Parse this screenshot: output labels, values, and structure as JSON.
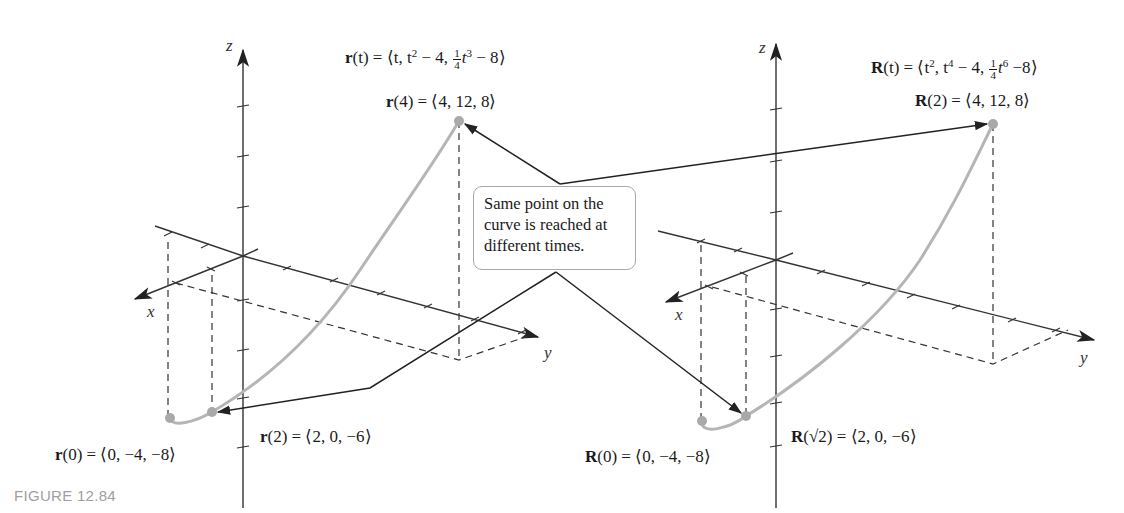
{
  "figure": {
    "caption": "FIGURE 12.84",
    "colors": {
      "axis": "#333333",
      "curve": "#b5b5b5",
      "point": "#a9a9a9",
      "arrow": "#222222",
      "callout_border": "#a8a8a8",
      "caption": "#a0a0a0"
    }
  },
  "left_plot": {
    "axes": {
      "x": "x",
      "y": "y",
      "z": "z"
    },
    "function": {
      "name": "r",
      "argument": "t",
      "components": [
        "t",
        "t² − 4",
        "¼t³ − 8"
      ]
    },
    "labels": {
      "fn_name": "r",
      "fn_arg": "(t) = ⟨t, t",
      "fn_mid1": " − 4, ",
      "fn_frac_num": "1",
      "fn_frac_den": "4",
      "fn_t": "t",
      "fn_exp3": "3",
      "fn_tail": " − 8⟩",
      "exp2": "2",
      "r4_name": "r",
      "r4_rest": "(4) = ⟨4, 12, 8⟩",
      "r2_name": "r",
      "r2_rest": "(2) = ⟨2, 0, −6⟩",
      "r0_name": "r",
      "r0_rest": "(0) = ⟨0, −4, −8⟩"
    },
    "points": [
      {
        "label": "r(0) = ⟨0, −4, −8⟩",
        "t": 0,
        "x": 0,
        "y": -4,
        "z": -8
      },
      {
        "label": "r(2) = ⟨2, 0, −6⟩",
        "t": 2,
        "x": 2,
        "y": 0,
        "z": -6
      },
      {
        "label": "r(4) = ⟨4, 12, 8⟩",
        "t": 4,
        "x": 4,
        "y": 12,
        "z": 8
      }
    ]
  },
  "right_plot": {
    "axes": {
      "x": "x",
      "y": "y",
      "z": "z"
    },
    "function": {
      "name": "R",
      "argument": "t",
      "components": [
        "t²",
        "t⁴ − 4",
        "¼t⁶ − 8"
      ]
    },
    "labels": {
      "fn_name": "R",
      "fn_arg": "(t) = ⟨t",
      "exp2": "2",
      "fn_mid0": ", t",
      "exp4": "4",
      "fn_mid1": " − 4, ",
      "fn_frac_num": "1",
      "fn_frac_den": "4",
      "fn_t": "t",
      "exp6": "6",
      "fn_tail": " −8⟩",
      "R2_name": "R",
      "R2_rest": "(2) = ⟨4, 12, 8⟩",
      "Rs2_name": "R",
      "Rs2_rest": "(√2) = ⟨2, 0, −6⟩",
      "R0_name": "R",
      "R0_rest": "(0) = ⟨0, −4, −8⟩"
    },
    "points": [
      {
        "label": "R(0) = ⟨0, −4, −8⟩",
        "t": "0",
        "x": 0,
        "y": -4,
        "z": -8
      },
      {
        "label": "R(√2) = ⟨2, 0, −6⟩",
        "t": "√2",
        "x": 2,
        "y": 0,
        "z": -6
      },
      {
        "label": "R(2) = ⟨4, 12, 8⟩",
        "t": "2",
        "x": 4,
        "y": 12,
        "z": 8
      }
    ]
  },
  "callout": {
    "lines": [
      "Same point on the",
      "curve is reached at",
      "different times."
    ]
  }
}
